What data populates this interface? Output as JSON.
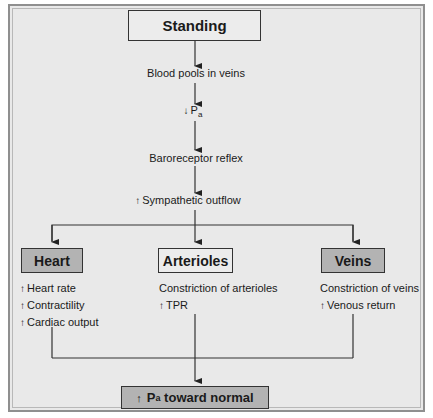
{
  "diagram": {
    "top_node": "Standing",
    "chain": [
      {
        "text": "Blood pools in veins"
      },
      {
        "arrow": "↓",
        "text": "P",
        "sub": "a"
      },
      {
        "text": "Baroreceptor reflex"
      },
      {
        "arrow": "↑",
        "text": "Sympathetic outflow"
      }
    ],
    "branches": [
      {
        "title": "Heart",
        "effects": [
          {
            "arrow": "↑",
            "text": "Heart rate"
          },
          {
            "arrow": "↑",
            "text": "Contractility"
          },
          {
            "arrow": "↑",
            "text": "Cardiac output"
          }
        ]
      },
      {
        "title": "Arterioles",
        "effects": [
          {
            "arrow": "",
            "text": "Constriction of arterioles"
          },
          {
            "arrow": "↑",
            "text": "TPR"
          }
        ]
      },
      {
        "title": "Veins",
        "effects": [
          {
            "arrow": "",
            "text": "Constriction of veins"
          },
          {
            "arrow": "↑",
            "text": "Venous return"
          }
        ]
      }
    ],
    "outcome": {
      "arrow": "↑",
      "text_main": "P",
      "sub": "a",
      "text_rest": " toward normal"
    }
  },
  "colors": {
    "panel_bg": "#e9e9e9",
    "gray_box": "#b3b3b3",
    "line": "#333333"
  }
}
